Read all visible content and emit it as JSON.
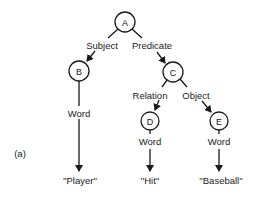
{
  "figure": {
    "panel_label": "(a)",
    "nodes": [
      {
        "id": "A",
        "label": "A",
        "cx": 125,
        "cy": 22,
        "r": 10
      },
      {
        "id": "B",
        "label": "B",
        "cx": 79,
        "cy": 71,
        "r": 10
      },
      {
        "id": "C",
        "label": "C",
        "cx": 173,
        "cy": 72,
        "r": 10
      },
      {
        "id": "D",
        "label": "D",
        "cx": 150,
        "cy": 121,
        "r": 9
      },
      {
        "id": "E",
        "label": "E",
        "cx": 219,
        "cy": 121,
        "r": 9
      }
    ],
    "edges": [
      {
        "from": "A",
        "to": "B",
        "label": "Subject"
      },
      {
        "from": "A",
        "to": "C",
        "label": "Predicate"
      },
      {
        "from": "C",
        "to": "D",
        "label": "Relation"
      },
      {
        "from": "C",
        "to": "E",
        "label": "Object"
      },
      {
        "from": "B",
        "to": "Player",
        "label": "Word"
      },
      {
        "from": "D",
        "to": "Hit",
        "label": "Word"
      },
      {
        "from": "E",
        "to": "Baseball",
        "label": "Word"
      }
    ],
    "edge_labels": {
      "subject": "Subject",
      "predicate": "Predicate",
      "relation": "Relation",
      "object": "Object",
      "word_b": "Word",
      "word_d": "Word",
      "word_e": "Word"
    },
    "leaves": {
      "player": "''Player''",
      "hit": "''Hit''",
      "baseball": "''Baseball''"
    },
    "node_labels": {
      "a": "A",
      "b": "B",
      "c": "C",
      "d": "D",
      "e": "E"
    }
  }
}
